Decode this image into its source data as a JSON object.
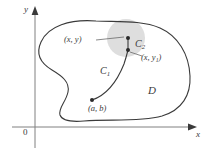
{
  "figure": {
    "axes": {
      "y_label": "y",
      "x_label": "x",
      "origin_label": "0"
    },
    "region_label": "D",
    "curves": [
      {
        "name": "C1",
        "base": "C",
        "subscript": "1"
      },
      {
        "name": "C2",
        "base": "C",
        "subscript": "2"
      }
    ],
    "points": [
      {
        "name": "start-point",
        "label": "(a, b)"
      },
      {
        "name": "upper-point",
        "label": "(x, y)"
      },
      {
        "name": "lower-point",
        "label_base": "(x, y",
        "label_subscript": "1",
        "label_close": ")"
      }
    ],
    "colors": {
      "stroke": "#3a3a3a",
      "disk_fill": "#dedede",
      "background": "#ffffff",
      "text": "#3a3a3a"
    }
  }
}
